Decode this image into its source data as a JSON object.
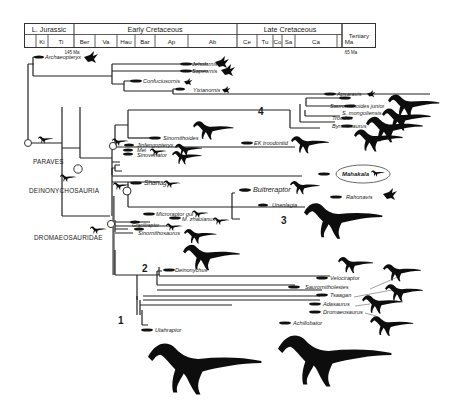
{
  "figure": {
    "timescale": {
      "eras": [
        {
          "label": "L. Jurassic",
          "stages": [
            "",
            "Ki",
            "Ti"
          ]
        },
        {
          "label": "Early Cretaceous",
          "stages": [
            "Ber",
            "Va",
            "Hau",
            "Bar",
            "Ap",
            "Ab"
          ]
        },
        {
          "label": "Late Cretaceous",
          "stages": [
            "Ce",
            "Tu",
            "Co",
            "Sa",
            "Ca",
            "Ma"
          ]
        },
        {
          "label": "Tertiary",
          "stages": []
        }
      ],
      "markers": {
        "start": "145 Ma",
        "end": "65 Ma"
      }
    },
    "clades": {
      "paraves": "PARAVES",
      "deinonychosauria": "DEINONYCHOSAURIA",
      "dromaeosauridae": "DROMAEOSAURIDAE"
    },
    "clade_numbers": [
      "1",
      "2",
      "3",
      "4"
    ],
    "taxa": {
      "archaeopteryx": "Archaeopteryx",
      "jeholornis": "Jeholornis",
      "sapeornis": "Sapeornis",
      "confuciusornis": "Confuciusornis",
      "yixianornis": "Yixianornis",
      "apsaravis": "Apsaravis",
      "saurornithoides_junior": "Saurornithoides junior",
      "s_mongoliensis": "S. mongoliensis",
      "troodon": "Troodon",
      "byronosaurus": "Byronosaurus",
      "sinornithoides": "Sinornithoides",
      "ek_troodontid": "EK troodontid",
      "jinfengopteryx": "Jinfengopteryx",
      "mei": "Mei",
      "sinovenator": "Sinovenator",
      "mahakala": "Mahakala",
      "shanag": "Shanag",
      "buitreraptor": "Buitreraptor",
      "rahonavis": "Rahonavis",
      "unenlagia": "Unenlagia",
      "microraptor_gui": "Microraptor gui",
      "m_zhaoianus": "M. zhaoianus",
      "graciliraptor": "Graciliraptor",
      "sinornithosaurus": "Sinornithosaurus",
      "deinonychus": "Deinonychus",
      "velociraptor": "Velociraptor",
      "saurornitholestes": "Saurornitholestes",
      "tsaagan": "Tsaagan",
      "adasaurus": "Adasaurus",
      "dromaeosaurus": "Dromaeosaurus",
      "achillobator": "Achillobator",
      "utahraptor": "Utahraptor"
    },
    "highlighted_taxon": "Mahakala"
  }
}
